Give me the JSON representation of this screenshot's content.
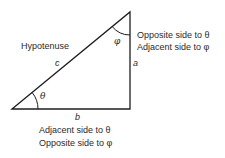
{
  "diagram": {
    "vertices": {
      "left": [
        12,
        109
      ],
      "top": [
        130,
        12
      ],
      "right_angle": [
        130,
        109
      ]
    },
    "labels": {
      "hypotenuse": "Hypotenuse",
      "side_c": "c",
      "side_a": "a",
      "side_b": "b",
      "angle_theta": "θ",
      "angle_phi": "φ"
    },
    "side_a_description": {
      "line1": "Opposite side to θ",
      "line2": "Adjacent side to φ"
    },
    "side_b_description": {
      "line1": "Adjacent side to θ",
      "line2": "Opposite side to φ"
    },
    "colors": {
      "stroke": "#1e1e1e",
      "text": "#2a2a2a",
      "background": "#ffffff"
    }
  }
}
